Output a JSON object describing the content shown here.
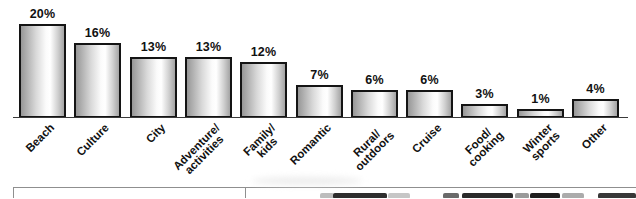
{
  "chart_data": {
    "type": "bar",
    "title": "",
    "xlabel": "",
    "ylabel": "",
    "categories": [
      "Beach",
      "Culture",
      "City",
      "Adventure/activities",
      "Family/kids",
      "Romantic",
      "Rural/outdoors",
      "Cruise",
      "Food/cooking",
      "Winter sports",
      "Other"
    ],
    "category_lines": [
      [
        "Beach"
      ],
      [
        "Culture"
      ],
      [
        "City"
      ],
      [
        "Adventure/",
        "activities"
      ],
      [
        "Family/",
        "kids"
      ],
      [
        "Romantic"
      ],
      [
        "Rural/",
        "outdoors"
      ],
      [
        "Cruise"
      ],
      [
        "Food/",
        "cooking"
      ],
      [
        "Winter",
        "sports"
      ],
      [
        "Other"
      ]
    ],
    "values": [
      20,
      16,
      13,
      13,
      12,
      7,
      6,
      6,
      3,
      1,
      4
    ],
    "value_labels": [
      "20%",
      "16%",
      "13%",
      "13%",
      "12%",
      "7%",
      "6%",
      "6%",
      "3%",
      "1%",
      "4%"
    ],
    "ylim": [
      0,
      20
    ],
    "grid": false,
    "legend": false,
    "bar_fill_gradient": [
      "#979797",
      "#ffffff",
      "#a4a4a4"
    ],
    "bar_border_color": "#141414",
    "axis_line_color": "#3a3a3a",
    "label_color": "#111111"
  },
  "bottom_strip": {
    "divider_color": "#8f8f8f",
    "left_panel_content": "",
    "right_panel_content": "photo-top-edge"
  }
}
